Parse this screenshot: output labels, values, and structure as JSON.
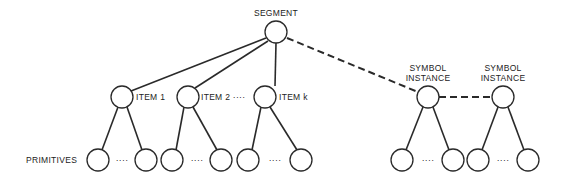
{
  "diagram": {
    "type": "tree-structure",
    "colors": {
      "stroke": "#2a2a2a",
      "background": "#ffffff",
      "text": "#222222"
    },
    "labels": {
      "segment": "SEGMENT",
      "item1": "ITEM 1",
      "item2": "ITEM 2 ····",
      "itemk": "ITEM k",
      "symbol1_line1": "SYMBOL",
      "symbol1_line2": "INSTANCE",
      "symbol2_line1": "SYMBOL",
      "symbol2_line2": "INSTANCE",
      "primitives": "PRIMITIVES",
      "ellipsis": "····"
    },
    "nodes": [
      {
        "id": "segment",
        "label": "SEGMENT",
        "level": 0
      },
      {
        "id": "item1",
        "label": "ITEM 1",
        "level": 1,
        "parent": "segment",
        "edge": "solid"
      },
      {
        "id": "item2",
        "label": "ITEM 2",
        "level": 1,
        "parent": "segment",
        "edge": "solid"
      },
      {
        "id": "itemk",
        "label": "ITEM k",
        "level": 1,
        "parent": "segment",
        "edge": "solid"
      },
      {
        "id": "symbol1",
        "label": "SYMBOL INSTANCE",
        "level": 1,
        "parent": "segment",
        "edge": "dashed"
      },
      {
        "id": "symbol2",
        "label": "SYMBOL INSTANCE",
        "level": 1,
        "parent": "symbol1",
        "edge": "dashed"
      },
      {
        "id": "primitives",
        "label": "PRIMITIVES",
        "level": 2,
        "note": "two leaf nodes per item / symbol instance separated by ellipsis"
      }
    ]
  }
}
